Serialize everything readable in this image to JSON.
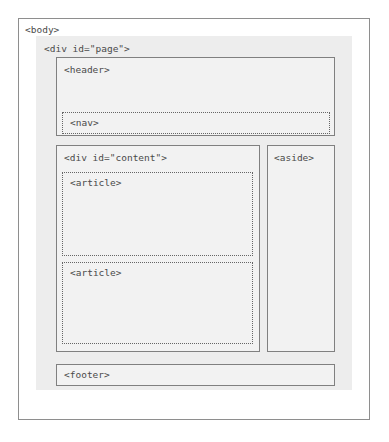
{
  "diagram": {
    "colors": {
      "canvas_background": "#ffffff",
      "outer_border": "#8e8e8e",
      "page_panel_background": "#ededed",
      "box_border_solid": "#808080",
      "box_border_dotted": "#666666",
      "box_background": "#f2f2f2",
      "label_text": "#4a4a4a"
    },
    "boxes": {
      "body": {
        "label": "<body>",
        "border_style": "solid"
      },
      "page": {
        "label": "<div id=\"page\">",
        "border_style": "none"
      },
      "header": {
        "label": "<header>",
        "border_style": "solid"
      },
      "nav": {
        "label": "<nav>",
        "border_style": "dotted"
      },
      "content": {
        "label": "<div id=\"content\">",
        "border_style": "solid"
      },
      "article_first": {
        "label": "<article>",
        "border_style": "dotted"
      },
      "article_second": {
        "label": "<article>",
        "border_style": "dotted"
      },
      "aside": {
        "label": "<aside>",
        "border_style": "solid"
      },
      "footer": {
        "label": "<footer>",
        "border_style": "solid"
      }
    }
  }
}
